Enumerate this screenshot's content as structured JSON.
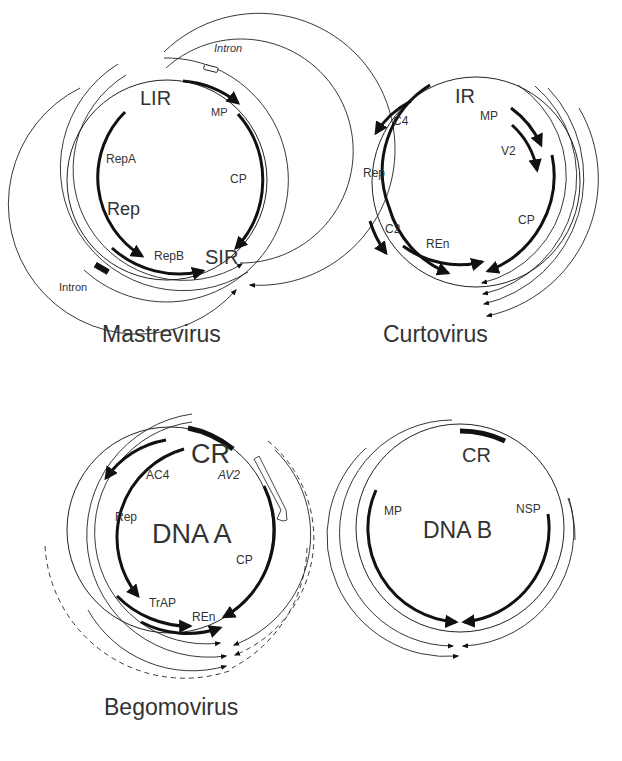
{
  "figure": {
    "panels": [
      {
        "id": "mastrevirus",
        "title": "Mastrevirus",
        "labels": {
          "intron_top": "Intron",
          "intron_bottom": "Intron",
          "lir": "LIR",
          "sir": "SIR",
          "mp": "MP",
          "cp": "CP",
          "repa": "RepA",
          "rep": "Rep",
          "repb": "RepB"
        }
      },
      {
        "id": "curtovirus",
        "title": "Curtovirus",
        "labels": {
          "ir": "IR",
          "c4": "C4",
          "mp": "MP",
          "v2": "V2",
          "rep": "Rep",
          "cp": "CP",
          "c2": "C2",
          "ren": "REn"
        }
      },
      {
        "id": "begomovirus-dna-a",
        "title": "Begomovirus",
        "labels": {
          "cr": "CR",
          "ac4": "AC4",
          "av2": "AV2",
          "rep": "Rep",
          "center": "DNA A",
          "cp": "CP",
          "trap": "TrAP",
          "ren": "REn"
        }
      },
      {
        "id": "begomovirus-dna-b",
        "title": "",
        "labels": {
          "cr": "CR",
          "mp": "MP",
          "nsp": "NSP",
          "center": "DNA B"
        }
      }
    ]
  }
}
